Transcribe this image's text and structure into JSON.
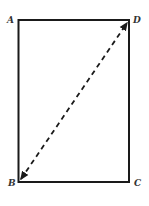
{
  "diagram": {
    "type": "rectangle-with-diagonal",
    "stroke_color": "#1a1a1a",
    "label_color": "#333333",
    "rectangle": {
      "x": 18.5,
      "y": 20,
      "width": 110.5,
      "height": 162
    },
    "diagonal": {
      "from": "B",
      "to": "D",
      "style": "dashed",
      "arrowheads": "both"
    },
    "vertices": [
      {
        "label": "A",
        "x": 18.5,
        "y": 20
      },
      {
        "label": "D",
        "x": 129,
        "y": 20
      },
      {
        "label": "B",
        "x": 18.5,
        "y": 182
      },
      {
        "label": "C",
        "x": 129,
        "y": 182
      }
    ],
    "labels": {
      "A": "A",
      "B": "B",
      "C": "C",
      "D": "D"
    }
  }
}
